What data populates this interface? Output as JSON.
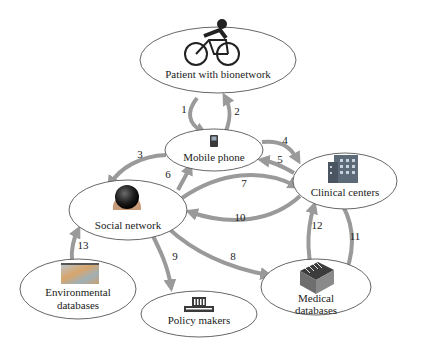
{
  "diagram": {
    "type": "network-flow",
    "colors": {
      "arrow": "#9a9a9a",
      "node_border": "#555555",
      "text": "#222222"
    },
    "nodes": [
      {
        "id": "patient",
        "label": "Patient with bionetwork",
        "icon": "cyclist-icon"
      },
      {
        "id": "mobile",
        "label": "Mobile phone",
        "icon": "mobile-phone-icon"
      },
      {
        "id": "clinical",
        "label": "Clinical centers",
        "icon": "building-icon"
      },
      {
        "id": "social",
        "label": "Social network",
        "icon": "globe-head-icon"
      },
      {
        "id": "env",
        "label_line1": "Environmental",
        "label_line2": "databases",
        "icon": "satellite-map-icon"
      },
      {
        "id": "medical",
        "label_line1": "Medical",
        "label_line2": "databases",
        "icon": "file-box-icon"
      },
      {
        "id": "policy",
        "label": "Policy makers",
        "icon": "government-building-icon"
      }
    ],
    "edges": [
      {
        "label": "1",
        "from": "patient",
        "to": "mobile"
      },
      {
        "label": "2",
        "from": "mobile",
        "to": "patient"
      },
      {
        "label": "3",
        "from": "mobile",
        "to": "social"
      },
      {
        "label": "4",
        "from": "mobile",
        "to": "clinical"
      },
      {
        "label": "5",
        "from": "clinical",
        "to": "mobile"
      },
      {
        "label": "6",
        "from": "social",
        "to": "mobile"
      },
      {
        "label": "7",
        "from": "social",
        "to": "clinical"
      },
      {
        "label": "8",
        "from": "social",
        "to": "medical"
      },
      {
        "label": "9",
        "from": "social",
        "to": "policy"
      },
      {
        "label": "10",
        "from": "clinical",
        "to": "social"
      },
      {
        "label": "11",
        "from": "clinical",
        "to": "medical"
      },
      {
        "label": "12",
        "from": "medical",
        "to": "clinical"
      },
      {
        "label": "13",
        "from": "env",
        "to": "social"
      }
    ]
  }
}
